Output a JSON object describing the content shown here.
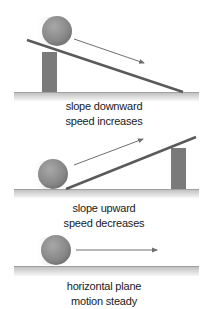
{
  "scenes": [
    {
      "id": "slope-down",
      "line1": "slope downward",
      "line2": "speed increases"
    },
    {
      "id": "slope-up",
      "line1": "slope upward",
      "line2": "speed decreases"
    },
    {
      "id": "horizontal",
      "line1": "horizontal plane",
      "line2": "motion steady"
    }
  ],
  "colors": {
    "ball": "#8a8a8a",
    "ball_highlight": "#b5b5b5",
    "plank": "#5a5a5a",
    "post": "#7a7a7a",
    "arrow": "#6e6e6e",
    "ground_top": "#8c8c8c",
    "ground_bottom": "#f5f5f5"
  }
}
